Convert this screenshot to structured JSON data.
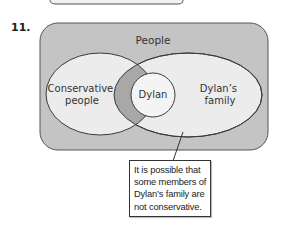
{
  "problem": {
    "number": "11."
  },
  "diagram": {
    "universe_label": "People",
    "sets": [
      {
        "id": "conservative",
        "label_lines": [
          "Conservative",
          "people"
        ]
      },
      {
        "id": "family",
        "label_lines": [
          "Dylan’s",
          "family"
        ]
      },
      {
        "id": "dylan",
        "label_lines": [
          "Dylan"
        ]
      }
    ],
    "callout": {
      "lines": [
        "It is possible that",
        "some members of",
        "Dylan’s family are",
        "not conservative."
      ]
    }
  },
  "colors": {
    "universe_fill": "#c4c4c4",
    "ellipse_fill": "#ececec",
    "intersection_fill": "#a8a8a8",
    "dylan_fill": "#f4f4f4",
    "stroke": "#3a3a3a"
  }
}
